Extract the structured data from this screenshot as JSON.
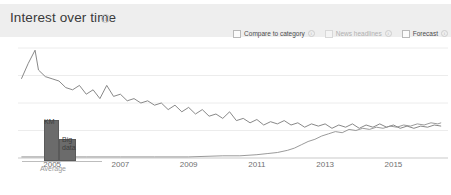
{
  "panel": {
    "title": "Interest over time",
    "info_icon": "info-icon",
    "info_glyph": "i"
  },
  "options": [
    {
      "label": "Compare to category",
      "checked": false,
      "muted": false,
      "has_info": true,
      "info_glyph": "i"
    },
    {
      "label": "News headlines",
      "checked": false,
      "muted": true,
      "has_info": true,
      "info_glyph": "i"
    },
    {
      "label": "Forecast",
      "checked": false,
      "muted": false,
      "has_info": true,
      "info_glyph": "i"
    }
  ],
  "average_overlay": {
    "axis_label": "Average",
    "bars": [
      {
        "label": "KM",
        "value": 41
      },
      {
        "label": "Big data",
        "value": 22
      }
    ]
  },
  "colors": {
    "header_band": "#eeeeee",
    "title_text": "#3a3a3a",
    "series_km": "#7a7a7a",
    "series_bigdata": "#8f8f8f",
    "bar_fill": "#6b6b6b",
    "gridline": "#ececec",
    "axis_line": "#c9c9c9",
    "tick_text": "#707070"
  },
  "chart_data": {
    "type": "line",
    "title": "Interest over time",
    "xlabel": "",
    "ylabel": "",
    "grid": true,
    "legend_position": "none",
    "xlim": [
      2004.0,
      2016.6
    ],
    "ylim": [
      0,
      100
    ],
    "xticks": [
      2005,
      2007,
      2009,
      2011,
      2013,
      2015
    ],
    "gridlines_y": [
      25,
      50,
      75,
      100
    ],
    "series": [
      {
        "name": "KM",
        "color": "#7a7a7a",
        "x": [
          2004.1,
          2004.3,
          2004.5,
          2004.6,
          2004.8,
          2005.0,
          2005.2,
          2005.4,
          2005.6,
          2005.8,
          2006.0,
          2006.2,
          2006.4,
          2006.6,
          2006.8,
          2007.0,
          2007.2,
          2007.4,
          2007.6,
          2007.8,
          2008.0,
          2008.2,
          2008.4,
          2008.6,
          2008.8,
          2009.0,
          2009.2,
          2009.4,
          2009.6,
          2009.8,
          2010.0,
          2010.2,
          2010.4,
          2010.6,
          2010.8,
          2011.0,
          2011.2,
          2011.4,
          2011.6,
          2011.8,
          2012.0,
          2012.2,
          2012.4,
          2012.6,
          2012.8,
          2013.0,
          2013.2,
          2013.4,
          2013.6,
          2013.8,
          2014.0,
          2014.2,
          2014.4,
          2014.6,
          2014.8,
          2015.0,
          2015.2,
          2015.4,
          2015.6,
          2015.8,
          2016.0,
          2016.2,
          2016.4
        ],
        "values": [
          72,
          86,
          98,
          80,
          74,
          72,
          70,
          64,
          62,
          66,
          58,
          62,
          54,
          66,
          56,
          58,
          52,
          54,
          50,
          52,
          48,
          50,
          44,
          48,
          42,
          46,
          40,
          44,
          38,
          40,
          36,
          42,
          34,
          36,
          32,
          35,
          30,
          33,
          31,
          34,
          30,
          32,
          28,
          31,
          29,
          31,
          27,
          30,
          28,
          31,
          27,
          30,
          28,
          31,
          28,
          30,
          27,
          29,
          27,
          29,
          28,
          30,
          29
        ]
      },
      {
        "name": "Big data",
        "color": "#8f8f8f",
        "x": [
          2004.1,
          2005.0,
          2006.0,
          2007.0,
          2008.0,
          2009.0,
          2010.0,
          2010.5,
          2011.0,
          2011.3,
          2011.6,
          2011.9,
          2012.1,
          2012.3,
          2012.5,
          2012.7,
          2012.9,
          2013.1,
          2013.3,
          2013.5,
          2013.7,
          2013.9,
          2014.1,
          2014.3,
          2014.5,
          2014.7,
          2014.9,
          2015.1,
          2015.3,
          2015.5,
          2015.7,
          2015.9,
          2016.1,
          2016.3,
          2016.4
        ],
        "values": [
          1,
          1,
          1,
          1,
          1,
          1,
          2,
          2,
          3,
          4,
          5,
          7,
          9,
          12,
          15,
          17,
          20,
          22,
          24,
          23,
          26,
          25,
          27,
          26,
          28,
          27,
          29,
          28,
          30,
          29,
          31,
          30,
          32,
          31,
          32
        ]
      }
    ]
  }
}
